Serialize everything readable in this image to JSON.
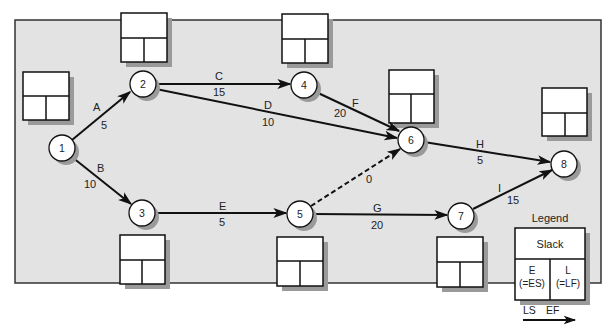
{
  "colors": {
    "panel_fill": "#e3e3e3",
    "panel_border": "#333333",
    "box_shadow": "#9a9a9a",
    "node_fill": "#ffffff",
    "stroke": "#111111"
  },
  "nodes": [
    {
      "id": "1",
      "label": "1",
      "x": 62,
      "y": 148
    },
    {
      "id": "2",
      "label": "2",
      "x": 143,
      "y": 84
    },
    {
      "id": "3",
      "label": "3",
      "x": 142,
      "y": 213
    },
    {
      "id": "4",
      "label": "4",
      "x": 304,
      "y": 85
    },
    {
      "id": "5",
      "label": "5",
      "x": 300,
      "y": 214
    },
    {
      "id": "6",
      "label": "6",
      "x": 411,
      "y": 140
    },
    {
      "id": "7",
      "label": "7",
      "x": 461,
      "y": 216
    },
    {
      "id": "8",
      "label": "8",
      "x": 564,
      "y": 164
    }
  ],
  "activities": [
    {
      "name": "A",
      "duration": "5",
      "from": "1",
      "to": "2",
      "dashed": false
    },
    {
      "name": "B",
      "duration": "10",
      "from": "1",
      "to": "3",
      "dashed": false
    },
    {
      "name": "C",
      "duration": "15",
      "from": "2",
      "to": "4",
      "dashed": false
    },
    {
      "name": "D",
      "duration": "10",
      "from": "2",
      "to": "6",
      "dashed": false
    },
    {
      "name": "E",
      "duration": "5",
      "from": "3",
      "to": "5",
      "dashed": false
    },
    {
      "name": "F",
      "duration": "20",
      "from": "4",
      "to": "6",
      "dashed": false
    },
    {
      "name": "dummy",
      "duration": "0",
      "from": "5",
      "to": "6",
      "dashed": true
    },
    {
      "name": "G",
      "duration": "20",
      "from": "5",
      "to": "7",
      "dashed": false
    },
    {
      "name": "H",
      "duration": "5",
      "from": "6",
      "to": "8",
      "dashed": false
    },
    {
      "name": "I",
      "duration": "15",
      "from": "7",
      "to": "8",
      "dashed": false
    }
  ],
  "labels": {
    "A": "A",
    "A_dur": "5",
    "B": "B",
    "B_dur": "10",
    "C": "C",
    "C_dur": "15",
    "D": "D",
    "D_dur": "10",
    "E": "E",
    "E_dur": "5",
    "F": "F",
    "F_dur": "20",
    "dummy_dur": "0",
    "G": "G",
    "G_dur": "20",
    "H": "H",
    "H_dur": "5",
    "I": "I",
    "I_dur": "15"
  },
  "slack_boxes": [
    {
      "node": "1",
      "slack": "",
      "E": "",
      "L": ""
    },
    {
      "node": "2",
      "slack": "",
      "E": "",
      "L": ""
    },
    {
      "node": "3",
      "slack": "",
      "E": "",
      "L": ""
    },
    {
      "node": "4",
      "slack": "",
      "E": "",
      "L": ""
    },
    {
      "node": "5",
      "slack": "",
      "E": "",
      "L": ""
    },
    {
      "node": "6",
      "slack": "",
      "E": "",
      "L": ""
    },
    {
      "node": "7",
      "slack": "",
      "E": "",
      "L": ""
    },
    {
      "node": "8",
      "slack": "",
      "E": "",
      "L": ""
    }
  ],
  "legend": {
    "title": "Legend",
    "slack": "Slack",
    "e_label": "E",
    "e_sub": "(=ES)",
    "l_label": "L",
    "l_sub": "(=LF)",
    "ls": "LS",
    "ef": "EF"
  }
}
